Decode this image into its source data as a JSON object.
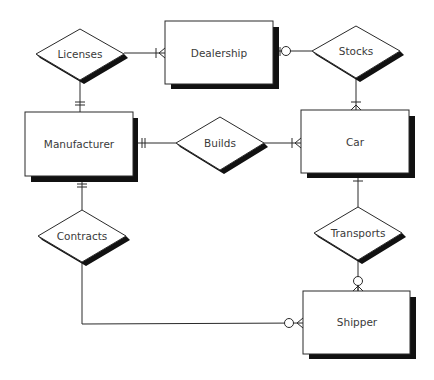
{
  "diagram": {
    "type": "entity-relationship",
    "notation": "crow's foot",
    "entities": [
      {
        "id": "dealership",
        "label": "Dealership"
      },
      {
        "id": "manufacturer",
        "label": "Manufacturer"
      },
      {
        "id": "car",
        "label": "Car"
      },
      {
        "id": "shipper",
        "label": "Shipper"
      }
    ],
    "relationships": [
      {
        "id": "licenses",
        "label": "Licenses",
        "from": "Manufacturer",
        "from_cardinality": "one and only one",
        "to": "Dealership",
        "to_cardinality": "one or many"
      },
      {
        "id": "stocks",
        "label": "Stocks",
        "from": "Dealership",
        "from_cardinality": "zero or one",
        "to": "Car",
        "to_cardinality": "one or many"
      },
      {
        "id": "builds",
        "label": "Builds",
        "from": "Manufacturer",
        "from_cardinality": "one and only one",
        "to": "Car",
        "to_cardinality": "one or many"
      },
      {
        "id": "contracts",
        "label": "Contracts",
        "from": "Manufacturer",
        "from_cardinality": "one and only one",
        "to": "Shipper",
        "to_cardinality": "zero or many"
      },
      {
        "id": "transports",
        "label": "Transports",
        "from": "Car",
        "from_cardinality": "one or many",
        "to": "Shipper",
        "to_cardinality": "zero or many"
      }
    ]
  },
  "colors": {
    "line": "#2a2a2a",
    "shadow": "#111111",
    "text": "#3a3a3a",
    "background": "#ffffff"
  }
}
